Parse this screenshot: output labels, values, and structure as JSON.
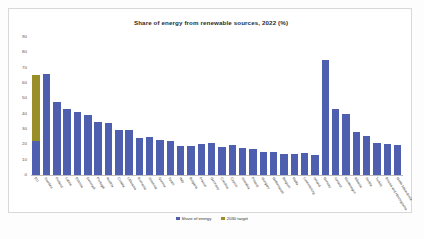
{
  "chart_data": {
    "type": "bar",
    "title": "Share of energy from renewable sources, 2022 (%)",
    "xlabel": "",
    "ylabel": "",
    "ylim": [
      0,
      90
    ],
    "yticks": [
      0,
      10,
      20,
      30,
      40,
      50,
      60,
      70,
      80,
      90
    ],
    "grid": false,
    "legend_position": "bottom",
    "legend": [
      "Share of energy",
      "2030 target"
    ],
    "colors": {
      "share": "#4e5fb0",
      "target": "#9a8e28",
      "frame": "#d8d8d8",
      "axis": "#bdbdbd"
    },
    "categories": [
      "EU",
      "Sweden",
      "Finland",
      "Latvia",
      "Estonia",
      "Denmark",
      "Portugal",
      "Austria",
      "Croatia",
      "Lithuania",
      "Romania",
      "Slovenia",
      "Greece",
      "Spain",
      "Italy",
      "Bulgaria",
      "France",
      "Germany",
      "Czechia",
      "Cyprus",
      "Slovakia",
      "Poland",
      "Hungary",
      "Netherlands",
      "Belgium",
      "Malta",
      "Luxembourg",
      "Ireland",
      "Norway",
      "Iceland",
      "Montenegro",
      "Albania",
      "Serbia",
      "Turkey",
      "Bosnia and Herzegovina",
      "North Macedonia"
    ],
    "series": [
      {
        "name": "Share of energy",
        "values": [
          22,
          66,
          47.5,
          43,
          41,
          39,
          34.7,
          33.8,
          29.5,
          29.5,
          24.1,
          25,
          22.7,
          22.1,
          19.1,
          19.1,
          20.3,
          20.8,
          18.2,
          19.5,
          17.3,
          16.9,
          15.2,
          15,
          13.8,
          13.4,
          14.4,
          13.1,
          75,
          43,
          39.5,
          28,
          25.3,
          21,
          20,
          19.5
        ]
      },
      {
        "name": "2030 target",
        "values": [
          43.5,
          null,
          null,
          null,
          null,
          null,
          null,
          null,
          null,
          null,
          null,
          null,
          null,
          null,
          null,
          null,
          null,
          null,
          null,
          null,
          null,
          null,
          null,
          null,
          null,
          null,
          null,
          null,
          null,
          null,
          null,
          null,
          null,
          null,
          null,
          null
        ]
      }
    ],
    "eu_total_with_target": 65.5
  }
}
